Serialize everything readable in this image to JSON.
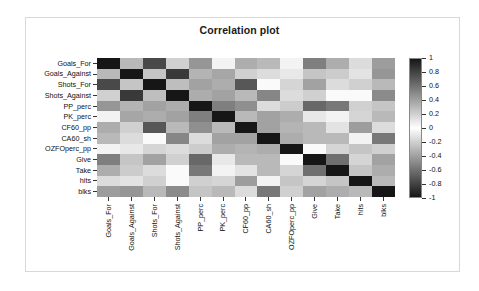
{
  "title": "Correlation plot",
  "chart_data": {
    "type": "heatmap",
    "title": "Correlation plot",
    "xlabel": "",
    "ylabel": "",
    "grid": false,
    "legend_position": "right",
    "colormap": "grayscale-diverging (black at -1 and +1, white at 0)",
    "colorbar": {
      "ticks": [
        "1",
        "0.8",
        "0.6",
        "0.4",
        "0.2",
        "0",
        "-0.2",
        "-0.4",
        "-0.6",
        "-0.8",
        "-1"
      ],
      "min": -1,
      "max": 1
    },
    "x_categories": [
      "Goals_For",
      "Goals_Against",
      "Shots_For",
      "Shots_Against",
      "PP_perc",
      "PK_perc",
      "CF60_pp",
      "CA60_sh",
      "OZFOperc_pp",
      "Give",
      "Take",
      "hits",
      "blks"
    ],
    "y_categories": [
      "Goals_For",
      "Goals_Against",
      "Shots_For",
      "Shots_Against",
      "PP_perc",
      "PK_perc",
      "CF60_pp",
      "CA60_sh",
      "OZFOperc_pp",
      "Give",
      "Take",
      "hits",
      "blks"
    ],
    "matrix": [
      [
        1.0,
        -0.3,
        0.78,
        -0.2,
        0.45,
        0.05,
        0.35,
        -0.3,
        0.05,
        0.55,
        -0.35,
        -0.15,
        0.42
      ],
      [
        -0.3,
        1.0,
        -0.25,
        0.85,
        0.32,
        0.38,
        -0.2,
        -0.15,
        0.1,
        0.25,
        -0.22,
        -0.12,
        0.45
      ],
      [
        0.78,
        -0.25,
        1.0,
        -0.28,
        0.4,
        0.35,
        0.72,
        -0.02,
        0.18,
        0.4,
        -0.15,
        -0.2,
        0.3
      ],
      [
        -0.2,
        0.85,
        -0.28,
        1.0,
        0.35,
        0.4,
        0.3,
        0.52,
        0.15,
        0.2,
        0.02,
        0.02,
        0.5
      ],
      [
        0.45,
        0.32,
        0.4,
        0.35,
        1.0,
        0.55,
        0.48,
        0.15,
        0.22,
        0.65,
        0.58,
        0.2,
        0.25
      ],
      [
        0.05,
        0.38,
        0.35,
        0.4,
        0.55,
        1.0,
        0.3,
        0.4,
        0.35,
        0.1,
        0.05,
        0.18,
        0.3
      ],
      [
        0.35,
        -0.2,
        0.72,
        0.3,
        0.48,
        0.3,
        1.0,
        0.4,
        0.32,
        0.3,
        0.12,
        0.42,
        0.15
      ],
      [
        -0.3,
        -0.15,
        -0.02,
        0.52,
        0.15,
        0.4,
        0.4,
        1.0,
        0.35,
        0.3,
        0.3,
        0.05,
        0.58
      ],
      [
        0.05,
        0.1,
        0.18,
        0.15,
        0.22,
        0.35,
        0.32,
        0.35,
        1.0,
        0.02,
        0.18,
        0.25,
        0.2
      ],
      [
        0.55,
        0.25,
        0.4,
        0.2,
        0.65,
        0.1,
        0.3,
        0.3,
        0.02,
        1.0,
        0.62,
        0.18,
        0.4
      ],
      [
        -0.35,
        -0.22,
        -0.15,
        0.02,
        0.58,
        0.05,
        0.12,
        0.3,
        0.18,
        0.62,
        1.0,
        0.25,
        0.35
      ],
      [
        -0.15,
        -0.12,
        -0.2,
        0.02,
        0.2,
        0.18,
        0.42,
        0.05,
        0.25,
        0.18,
        0.25,
        1.0,
        0.3
      ],
      [
        0.42,
        0.45,
        0.3,
        0.5,
        0.25,
        0.3,
        0.15,
        0.58,
        0.2,
        0.4,
        0.35,
        0.3,
        1.0
      ]
    ]
  }
}
